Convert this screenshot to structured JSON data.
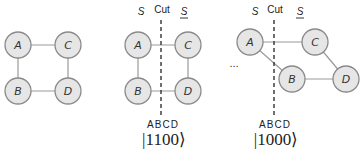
{
  "graph1": {
    "nodes": {
      "A": "A",
      "B": "B",
      "C": "C",
      "D": "D"
    }
  },
  "graph2": {
    "header": {
      "s": "S",
      "cut": "Cut",
      "s_bar": "S"
    },
    "nodes": {
      "A": "A",
      "B": "B",
      "C": "C",
      "D": "D"
    },
    "order_label": "ABCD",
    "state": "|1100⟩"
  },
  "ellipsis": "...",
  "graph3": {
    "header": {
      "s": "S",
      "cut": "Cut",
      "s_bar": "S"
    },
    "nodes": {
      "A": "A",
      "B": "B",
      "C": "C",
      "D": "D"
    },
    "order_label": "ABCD",
    "state": "|1000⟩"
  },
  "colors": {
    "node_fill": "#e6e6e6",
    "node_stroke": "#8a8a8a",
    "edge": "#9a9a9a",
    "cut_line": "#333333"
  }
}
